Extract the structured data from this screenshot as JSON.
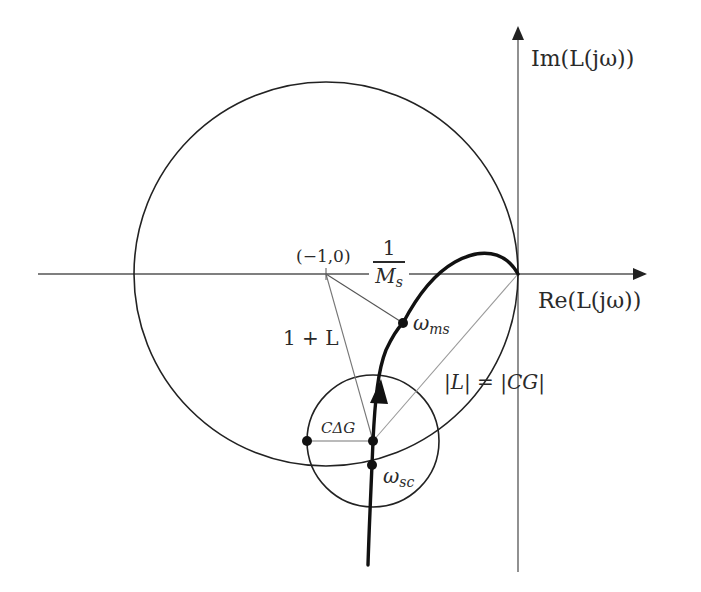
{
  "diagram": {
    "type": "nyquist-plot",
    "axes": {
      "real_label": "Re(L(jω))",
      "imag_label": "Im(L(jω))"
    },
    "labels": {
      "critical_point": "(−1,0)",
      "sensitivity_num": "1",
      "sensitivity_den_main": "M",
      "sensitivity_den_sub": "s",
      "return_difference": "1 + L",
      "omega_ms_main": "ω",
      "omega_ms_sub": "ms",
      "omega_sc_main": "ω",
      "omega_sc_sub": "sc",
      "uncertainty": "CΔG",
      "magnitude_eq": "|L| = |CG|"
    },
    "colors": {
      "stroke": "#222222",
      "thin_stroke": "#555555",
      "light_stroke": "#9a9a9a",
      "background": "#ffffff"
    }
  }
}
